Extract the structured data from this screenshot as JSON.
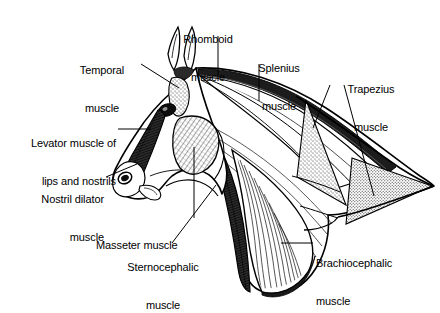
{
  "figure": {
    "background_color": "#ffffff",
    "line_color": "#000000",
    "view": "left lateral view"
  },
  "labels": [
    {
      "id": "rhomboid",
      "name": "Rhomboid muscle",
      "line1": "Rhomboid",
      "line2": "muscle",
      "align": "center",
      "x": 160,
      "y": 8,
      "width": 96,
      "leader": "vertical"
    },
    {
      "id": "temporal",
      "name": "Temporal muscle",
      "line1": "Temporal",
      "line2": "muscle",
      "align": "center",
      "x": 59,
      "y": 39,
      "width": 86,
      "leader": "diagonal-down-right"
    },
    {
      "id": "splenius",
      "name": "Splenius muscle",
      "line1": "Splenius",
      "line2": "muscle",
      "align": "center",
      "x": 236,
      "y": 37,
      "width": 86,
      "leader": "vertical"
    },
    {
      "id": "trapezius",
      "name": "Trapezius muscle",
      "line1": "Trapezius",
      "line2": "muscle",
      "align": "center",
      "x": 325,
      "y": 58,
      "width": 92,
      "leader": "forked-double"
    },
    {
      "id": "levator",
      "name": "Levator muscle of lips and nostrils",
      "line1": "Levator muscle of",
      "line2": "lips and nostrils",
      "align": "right",
      "x": 6,
      "y": 112,
      "width": 110,
      "leader": "horizontal"
    },
    {
      "id": "nostril-dilator",
      "name": "Nostril dilator muscle",
      "line1": "Nostril dilator",
      "line2": "muscle",
      "align": "right",
      "x": 10,
      "y": 168,
      "width": 94,
      "leader": "diagonal-up-right"
    },
    {
      "id": "masseter",
      "name": "Masseter muscle",
      "line1": "Masseter muscle",
      "line2": "",
      "align": "left",
      "x": 96,
      "y": 214,
      "width": 108,
      "leader": "vertical"
    },
    {
      "id": "sternocephalic",
      "name": "Sternocephalic muscle",
      "line1": "Sternocephalic",
      "line2": "muscle",
      "align": "center",
      "x": 112,
      "y": 236,
      "width": 102,
      "leader": "diagonal-up-right"
    },
    {
      "id": "brachiocephalic",
      "name": "Brachiocephalic muscle",
      "line1": "Brachiocephalic",
      "line2": "muscle",
      "align": "left",
      "x": 316,
      "y": 232,
      "width": 104,
      "leader": "horizontal"
    }
  ],
  "structures": [
    {
      "id": "ear-left",
      "name": "left ear"
    },
    {
      "id": "ear-right",
      "name": "right ear"
    },
    {
      "id": "eye",
      "name": "eye"
    },
    {
      "id": "nostril",
      "name": "nostril"
    },
    {
      "id": "temporal-muscle-body",
      "name": "temporal muscle (stippled patch behind eye)"
    },
    {
      "id": "masseter-muscle-body",
      "name": "masseter muscle (cross-hatched cheek patch)"
    },
    {
      "id": "levator-muscle-body",
      "name": "levator muscle of lips and nostrils (shaded strip along face)"
    },
    {
      "id": "splenius-muscle-body",
      "name": "splenius muscle (striated upper neck)"
    },
    {
      "id": "rhomboid-muscle-body",
      "name": "rhomboid muscle (crest band of neck)"
    },
    {
      "id": "brachiocephalic-muscle-body",
      "name": "brachiocephalic muscle (striated lower neck)"
    },
    {
      "id": "sternocephalic-muscle-body",
      "name": "sternocephalic muscle (dark strip along ventral neck)"
    },
    {
      "id": "trapezius-cervical",
      "name": "trapezius muscle cervical part (upper stippled triangle)"
    },
    {
      "id": "trapezius-thoracic",
      "name": "trapezius muscle thoracic part (lower stippled triangle)"
    }
  ]
}
